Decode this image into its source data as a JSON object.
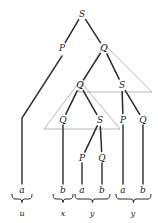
{
  "diagram": {
    "colors": {
      "branch": "#2b2b2b",
      "triangle": "#9a9a9a",
      "leaf_stem": "#3a3a3a",
      "text": "#1a1a1a",
      "background": "#ffffff"
    },
    "nodes": [
      {
        "id": "n1",
        "label": "S",
        "x": 82,
        "y": 14
      },
      {
        "id": "n2",
        "label": "P",
        "x": 62,
        "y": 48
      },
      {
        "id": "n3",
        "label": "Q",
        "x": 104,
        "y": 48
      },
      {
        "id": "n4",
        "label": "Q",
        "x": 80,
        "y": 85
      },
      {
        "id": "n5",
        "label": "S",
        "x": 122,
        "y": 85
      },
      {
        "id": "n6",
        "label": "Q",
        "x": 63,
        "y": 120
      },
      {
        "id": "n7",
        "label": "S",
        "x": 100,
        "y": 120
      },
      {
        "id": "n8",
        "label": "P",
        "x": 123,
        "y": 120
      },
      {
        "id": "n9",
        "label": "Q",
        "x": 143,
        "y": 120
      },
      {
        "id": "n10",
        "label": "P",
        "x": 82,
        "y": 158
      },
      {
        "id": "n11",
        "label": "Q",
        "x": 102,
        "y": 158
      }
    ],
    "branches": [
      {
        "from": "n1",
        "to": "n2"
      },
      {
        "from": "n1",
        "to": "n3"
      },
      {
        "from": "n3",
        "to": "n4"
      },
      {
        "from": "n3",
        "to": "n5"
      },
      {
        "from": "n4",
        "to": "n6"
      },
      {
        "from": "n4",
        "to": "n7"
      },
      {
        "from": "n5",
        "to": "n8"
      },
      {
        "from": "n5",
        "to": "n9"
      },
      {
        "from": "n7",
        "to": "n10"
      },
      {
        "from": "n7",
        "to": "n11"
      }
    ],
    "triangles": [
      {
        "id": "t1",
        "apex_x": 104,
        "apex_y": 44,
        "base_y": 92,
        "base_left": 78,
        "base_right": 152
      },
      {
        "id": "t2",
        "apex_x": 80,
        "apex_y": 81,
        "base_y": 129,
        "base_left": 44,
        "base_right": 120
      }
    ],
    "leaves": [
      {
        "id": "l1",
        "label": "a",
        "x": 22,
        "y": 190,
        "stem_top": 118,
        "stem_x": 22,
        "bend_from_x": 62,
        "bend_from_y": 56
      },
      {
        "id": "l2",
        "label": "b",
        "x": 63,
        "y": 190,
        "stem_top": 125,
        "stem_x": 63
      },
      {
        "id": "l3",
        "label": "a",
        "x": 82,
        "y": 190,
        "stem_top": 163,
        "stem_x": 82
      },
      {
        "id": "l4",
        "label": "b",
        "x": 102,
        "y": 190,
        "stem_top": 163,
        "stem_x": 102
      },
      {
        "id": "l5",
        "label": "a",
        "x": 123,
        "y": 190,
        "stem_top": 125,
        "stem_x": 123
      },
      {
        "id": "l6",
        "label": "b",
        "x": 143,
        "y": 190,
        "stem_top": 125,
        "stem_x": 143
      }
    ],
    "groups": [
      {
        "id": "g1",
        "label": "u",
        "left": 12,
        "right": 32,
        "brace_y": 199,
        "label_x": 22,
        "label_y": 214
      },
      {
        "id": "g2",
        "label": "x",
        "left": 53,
        "right": 73,
        "brace_y": 199,
        "label_x": 63,
        "label_y": 214
      },
      {
        "id": "g3",
        "label": "y",
        "left": 75,
        "right": 110,
        "brace_y": 199,
        "label_x": 92,
        "label_y": 214
      },
      {
        "id": "g4",
        "label": "y",
        "left": 116,
        "right": 151,
        "brace_y": 199,
        "label_x": 133,
        "label_y": 214
      }
    ]
  }
}
